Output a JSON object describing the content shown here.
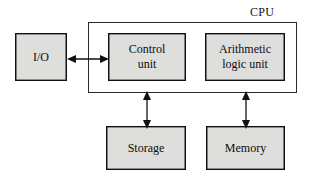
{
  "diagram": {
    "group_label": "CPU",
    "colors": {
      "block_fill": "#dededd",
      "block_stroke": "#111111",
      "container_stroke": "#2a2a2a",
      "background": "#ffffff",
      "arrow": "#111111"
    },
    "blocks": [
      {
        "id": "io",
        "label": "I/O",
        "inside_cpu": false
      },
      {
        "id": "cu",
        "label": "Control\nunit",
        "inside_cpu": true
      },
      {
        "id": "alu",
        "label": "Arithmetic\nlogic unit",
        "inside_cpu": true
      },
      {
        "id": "storage",
        "label": "Storage",
        "inside_cpu": false
      },
      {
        "id": "memory",
        "label": "Memory",
        "inside_cpu": false
      }
    ],
    "connectors": [
      {
        "id": "io-cu",
        "from": "io",
        "to": "cu",
        "orientation": "horizontal",
        "arrowheads": "both"
      },
      {
        "id": "cu-stor",
        "from": "cu",
        "to": "storage",
        "orientation": "vertical",
        "arrowheads": "both"
      },
      {
        "id": "alu-mem",
        "from": "alu",
        "to": "memory",
        "orientation": "vertical",
        "arrowheads": "both"
      }
    ]
  }
}
